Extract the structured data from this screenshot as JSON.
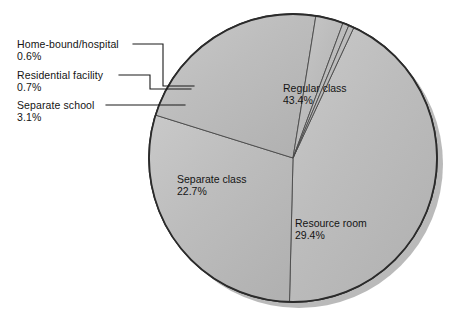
{
  "chart_data": {
    "type": "pie",
    "title": "",
    "subtitle": "",
    "xlabel": "",
    "ylabel": "",
    "grid": false,
    "legend_position": "none",
    "unit": "%",
    "total": 99.9,
    "categories": [
      "Regular class",
      "Resource room",
      "Separate class",
      "Separate school",
      "Residential facility",
      "Home-bound/hospital"
    ],
    "values": [
      43.4,
      29.4,
      22.7,
      3.1,
      0.7,
      0.6
    ],
    "slices": [
      {
        "name": "Regular class",
        "label": "Regular class",
        "value": 43.4,
        "value_label": "43.4%",
        "label_placement": "inside",
        "color": "#bcbcbc"
      },
      {
        "name": "Resource room",
        "label": "Resource room",
        "value": 29.4,
        "value_label": "29.4%",
        "label_placement": "inside",
        "color": "#bcbcbc"
      },
      {
        "name": "Separate class",
        "label": "Separate class",
        "value": 22.7,
        "value_label": "22.7%",
        "label_placement": "inside",
        "color": "#bcbcbc"
      },
      {
        "name": "Separate school",
        "label": "Separate school",
        "value": 3.1,
        "value_label": "3.1%",
        "label_placement": "callout",
        "color": "#bcbcbc"
      },
      {
        "name": "Residential facility",
        "label": "Residential facility",
        "value": 0.7,
        "value_label": "0.7%",
        "label_placement": "callout",
        "color": "#bcbcbc"
      },
      {
        "name": "Home-bound/hospital",
        "label": "Home-bound/hospital",
        "value": 0.6,
        "value_label": "0.6%",
        "label_placement": "callout",
        "color": "#bcbcbc"
      }
    ],
    "colors": {
      "slice_fill": "#bcbcbc",
      "slice_fill_light": "#c6c6c6",
      "slice_fill_dark": "#b0b0b0",
      "slice_edge": "#4a4a4a",
      "outline": "#2b2b2b",
      "shadow": "#2a2a2a",
      "leader_line": "#1b1b1b",
      "text": "#141414",
      "background": "#ffffff"
    }
  },
  "labels": {
    "regular_class": {
      "name": "Regular class",
      "percent": "43.4%"
    },
    "resource_room": {
      "name": "Resource room",
      "percent": "29.4%"
    },
    "separate_class": {
      "name": "Separate class",
      "percent": "22.7%"
    },
    "separate_school": {
      "name": "Separate school",
      "percent": "3.1%"
    },
    "residential_facility": {
      "name": "Residential facility",
      "percent": "0.7%"
    },
    "home_bound_hospital": {
      "name": "Home-bound/hospital",
      "percent": "0.6%"
    }
  }
}
